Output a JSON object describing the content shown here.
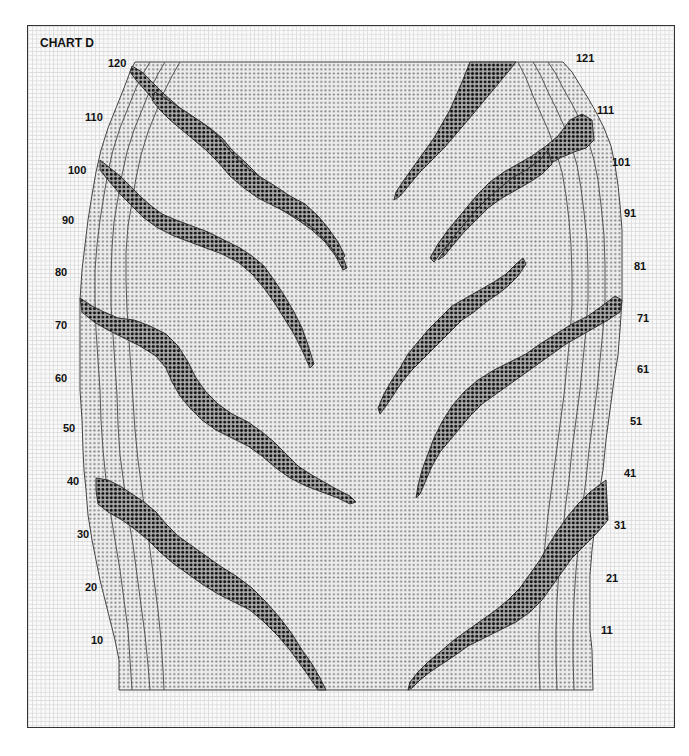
{
  "title": "CHART D",
  "left_row_labels": [
    {
      "label": "120",
      "x": 108,
      "y": 57
    },
    {
      "label": "110",
      "x": 85,
      "y": 111
    },
    {
      "label": "100",
      "x": 68,
      "y": 164
    },
    {
      "label": "90",
      "x": 62,
      "y": 214
    },
    {
      "label": "80",
      "x": 55,
      "y": 266
    },
    {
      "label": "70",
      "x": 55,
      "y": 319
    },
    {
      "label": "60",
      "x": 55,
      "y": 372
    },
    {
      "label": "50",
      "x": 63,
      "y": 422
    },
    {
      "label": "40",
      "x": 67,
      "y": 475
    },
    {
      "label": "30",
      "x": 77,
      "y": 528
    },
    {
      "label": "20",
      "x": 85,
      "y": 581
    },
    {
      "label": "10",
      "x": 91,
      "y": 634
    }
  ],
  "right_row_labels": [
    {
      "label": "121",
      "x": 576,
      "y": 52
    },
    {
      "label": "111",
      "x": 597,
      "y": 104
    },
    {
      "label": "101",
      "x": 612,
      "y": 156
    },
    {
      "label": "91",
      "x": 624,
      "y": 207
    },
    {
      "label": "81",
      "x": 634,
      "y": 260
    },
    {
      "label": "71",
      "x": 637,
      "y": 312
    },
    {
      "label": "61",
      "x": 637,
      "y": 363
    },
    {
      "label": "51",
      "x": 630,
      "y": 415
    },
    {
      "label": "41",
      "x": 624,
      "y": 467
    },
    {
      "label": "31",
      "x": 614,
      "y": 519
    },
    {
      "label": "21",
      "x": 606,
      "y": 572
    },
    {
      "label": "11",
      "x": 601,
      "y": 624
    }
  ],
  "colors": {
    "grid_line": "#dcdcdc",
    "body_fill": "#e8e8e8",
    "body_dot": "#8a8a8a",
    "stripe_fill": "#9a9a9a",
    "stripe_dot": "#111111",
    "outline": "#555555"
  },
  "legend": {
    "light_dots": "main color stitches",
    "dark_dots": "contrast stripe stitches"
  }
}
